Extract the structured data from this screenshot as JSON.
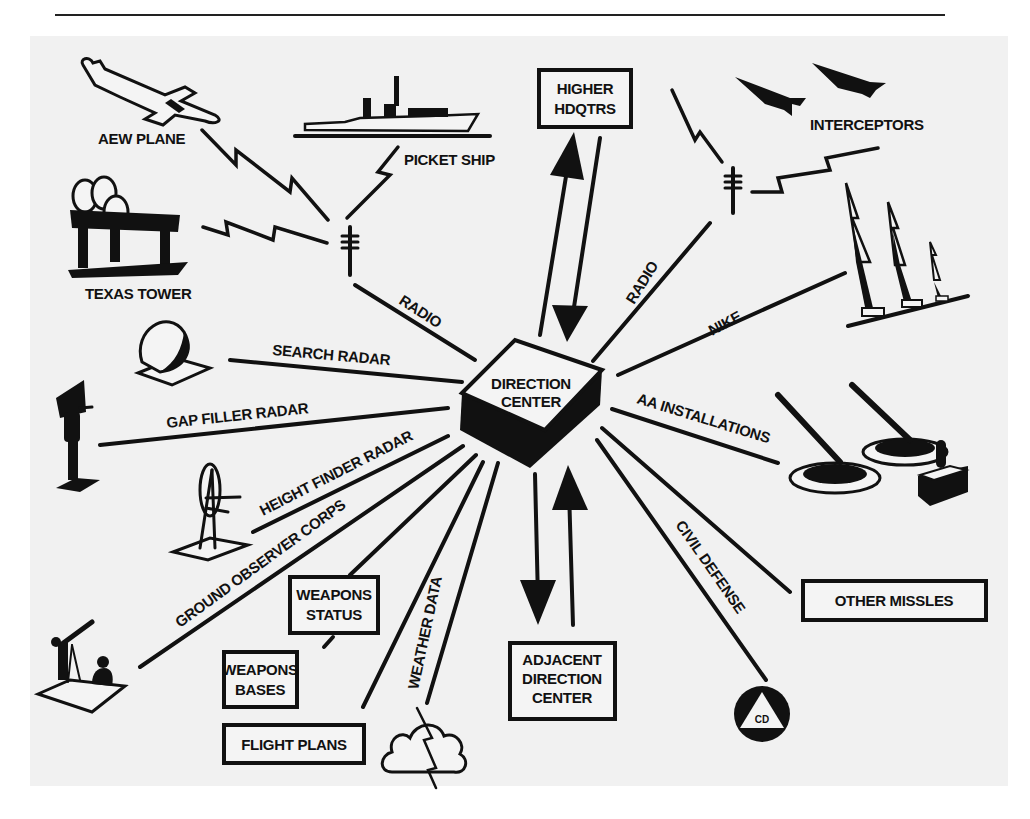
{
  "diagram": {
    "center": {
      "label_lines": [
        "DIRECTION",
        "CENTER"
      ]
    },
    "boxes": {
      "higher_hq": [
        "HIGHER",
        "HDQTRS"
      ],
      "adjacent_dc": [
        "ADJACENT",
        "DIRECTION",
        "CENTER"
      ],
      "weapons_status": [
        "WEAPONS",
        "STATUS"
      ],
      "weapons_bases": [
        "WEAPONS",
        "BASES"
      ],
      "flight_plans": [
        "FLIGHT PLANS"
      ],
      "other_missiles": [
        "OTHER MISSLES"
      ]
    },
    "labels": {
      "aew_plane": "AEW PLANE",
      "picket_ship": "PICKET SHIP",
      "texas_tower": "TEXAS TOWER",
      "interceptors": "INTERCEPTORS",
      "radio_left": "RADIO",
      "radio_right": "RADIO",
      "nike": "NIKE",
      "search_radar": "SEARCH RADAR",
      "gap_filler_radar": "GAP FILLER RADAR",
      "height_finder_radar": "HEIGHT FINDER RADAR",
      "ground_observer_corps": "GROUND OBSERVER CORPS",
      "aa_installations": "AA INSTALLATIONS",
      "weather_data": "WEATHER DATA",
      "civil_defense": "CIVIL DEFENSE",
      "cd_badge": "CD"
    },
    "icons": [
      "aew-plane-icon",
      "picket-ship-icon",
      "texas-tower-icon",
      "radio-antenna-icon",
      "interceptor-jet-icon",
      "nike-missile-icon",
      "search-radar-icon",
      "gap-filler-radar-icon",
      "height-finder-radar-icon",
      "ground-observer-icon",
      "aa-gun-icon",
      "storm-cloud-icon",
      "civil-defense-icon"
    ]
  }
}
